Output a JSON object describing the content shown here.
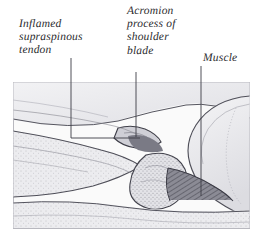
{
  "figure": {
    "kind": "anatomical-illustration",
    "frame": {
      "x": 13,
      "y": 82,
      "width": 237,
      "height": 147
    },
    "background_color": "#ffffff",
    "plate_color": "#f7f7f7",
    "ink_color": "#4a4a52",
    "text_color": "#2b2b2e",
    "muscle_fill_color": "#7e7e88",
    "bone_fill_color": "#e9e9ec"
  },
  "labels": [
    {
      "id": "tendon",
      "text": "Inflamed\nsupraspinous\ntendon",
      "leader": {
        "x1": 71,
        "y1": 58,
        "x2": 71,
        "y2": 138,
        "x3": 140,
        "y3": 138
      }
    },
    {
      "id": "acromion",
      "text": "Acromion\nprocess of\nshoulder\nblade",
      "leader": {
        "x1": 136,
        "y1": 72,
        "x2": 136,
        "y2": 137
      }
    },
    {
      "id": "muscle",
      "text": "Muscle",
      "leader": {
        "x1": 201,
        "y1": 66,
        "x2": 201,
        "y2": 196
      }
    }
  ]
}
